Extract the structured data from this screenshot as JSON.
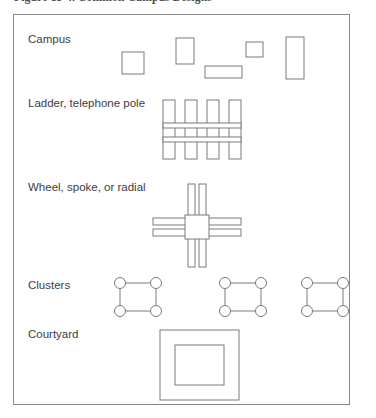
{
  "figure": {
    "caption": "Figure 11-4.  Common Campus Designs",
    "frame": {
      "x": 13,
      "y": 14,
      "width": 337,
      "height": 391,
      "border_color": "#888888"
    },
    "stroke_color": "#7a7a7a",
    "fill_color": "#ffffff",
    "text_color": "#3c3c3c",
    "background_color": "#ffffff"
  },
  "rows": [
    {
      "id": "campus",
      "label": "Campus",
      "label_x": 28,
      "label_y": 43,
      "shapes": [
        {
          "name": "campus-building-1",
          "type": "rect",
          "x": 122,
          "y": 52,
          "width": 22,
          "height": 22
        },
        {
          "name": "campus-building-2",
          "type": "rect",
          "x": 176,
          "y": 38,
          "width": 18,
          "height": 26
        },
        {
          "name": "campus-building-3",
          "type": "rect",
          "x": 205,
          "y": 66,
          "width": 37,
          "height": 12
        },
        {
          "name": "campus-building-4",
          "type": "rect",
          "x": 246,
          "y": 42,
          "width": 17,
          "height": 15
        },
        {
          "name": "campus-building-5",
          "type": "rect",
          "x": 286,
          "y": 37,
          "width": 18,
          "height": 42
        }
      ]
    },
    {
      "id": "ladder",
      "label": "Ladder, telephone pole",
      "label_x": 28,
      "label_y": 107,
      "shapes": [
        {
          "name": "ladder-rail-1",
          "type": "rect",
          "x": 163,
          "y": 100,
          "width": 12,
          "height": 59
        },
        {
          "name": "ladder-rail-2",
          "type": "rect",
          "x": 185,
          "y": 100,
          "width": 12,
          "height": 59
        },
        {
          "name": "ladder-rail-3",
          "type": "rect",
          "x": 207,
          "y": 100,
          "width": 12,
          "height": 59
        },
        {
          "name": "ladder-rail-4",
          "type": "rect",
          "x": 229,
          "y": 100,
          "width": 12,
          "height": 59
        },
        {
          "name": "ladder-rung-upper",
          "type": "rect",
          "x": 163,
          "y": 123,
          "width": 78,
          "height": 5
        },
        {
          "name": "ladder-rung-lower",
          "type": "rect",
          "x": 163,
          "y": 137,
          "width": 78,
          "height": 5
        }
      ]
    },
    {
      "id": "wheel",
      "label": "Wheel, spoke, or radial",
      "label_x": 28,
      "label_y": 191,
      "shapes": [
        {
          "name": "wheel-spoke-north-a",
          "type": "rect",
          "x": 188,
          "y": 184,
          "width": 7,
          "height": 33
        },
        {
          "name": "wheel-spoke-north-b",
          "type": "rect",
          "x": 199,
          "y": 184,
          "width": 7,
          "height": 33
        },
        {
          "name": "wheel-spoke-south-a",
          "type": "rect",
          "x": 188,
          "y": 234,
          "width": 7,
          "height": 33
        },
        {
          "name": "wheel-spoke-south-b",
          "type": "rect",
          "x": 199,
          "y": 234,
          "width": 7,
          "height": 33
        },
        {
          "name": "wheel-spoke-west-a",
          "type": "rect",
          "x": 153,
          "y": 218,
          "width": 33,
          "height": 7
        },
        {
          "name": "wheel-spoke-west-b",
          "type": "rect",
          "x": 153,
          "y": 229,
          "width": 33,
          "height": 7
        },
        {
          "name": "wheel-spoke-east-a",
          "type": "rect",
          "x": 208,
          "y": 218,
          "width": 33,
          "height": 7
        },
        {
          "name": "wheel-spoke-east-b",
          "type": "rect",
          "x": 208,
          "y": 229,
          "width": 33,
          "height": 7
        },
        {
          "name": "wheel-hub",
          "type": "rect",
          "x": 185,
          "y": 215,
          "width": 24,
          "height": 24
        }
      ]
    },
    {
      "id": "clusters",
      "label": "Clusters",
      "label_x": 28,
      "label_y": 289,
      "clusters": [
        {
          "name": "cluster-1",
          "cx": 138,
          "cy": 297,
          "half_width": 18,
          "half_height": 14,
          "radius": 5.5
        },
        {
          "name": "cluster-2",
          "cx": 243,
          "cy": 297,
          "half_width": 18,
          "half_height": 14,
          "radius": 5.5
        },
        {
          "name": "cluster-3",
          "cx": 325,
          "cy": 297,
          "half_width": 18,
          "half_height": 14,
          "radius": 5.5
        }
      ]
    },
    {
      "id": "courtyard",
      "label": "Courtyard",
      "label_x": 28,
      "label_y": 338,
      "shapes": [
        {
          "name": "courtyard-outer-block",
          "type": "rect",
          "x": 160,
          "y": 330,
          "width": 79,
          "height": 70
        },
        {
          "name": "courtyard-inner-open-space",
          "type": "rect",
          "x": 175,
          "y": 345,
          "width": 49,
          "height": 40
        }
      ]
    }
  ]
}
